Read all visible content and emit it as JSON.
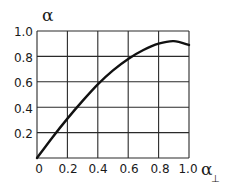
{
  "chart_data": {
    "type": "line",
    "title": "",
    "xlabel": "α⊥",
    "ylabel": "α",
    "xlim": [
      0,
      1.0
    ],
    "ylim": [
      0,
      1.0
    ],
    "grid": true,
    "x_ticks": [
      "0",
      "0.2",
      "0.4",
      "0.6",
      "0.8",
      "1.0"
    ],
    "y_ticks": [
      "0.2",
      "0.4",
      "0.6",
      "0.8",
      "1.0"
    ],
    "series": [
      {
        "name": "α",
        "x": [
          0,
          0.1,
          0.2,
          0.3,
          0.4,
          0.5,
          0.6,
          0.7,
          0.8,
          0.9,
          1.0
        ],
        "values": [
          0,
          0.16,
          0.31,
          0.45,
          0.58,
          0.69,
          0.78,
          0.85,
          0.9,
          0.92,
          0.89
        ]
      }
    ]
  },
  "labels": {
    "y_axis": "α",
    "x_axis_main": "α",
    "x_axis_sub": "⊥",
    "x_ticks": [
      "0",
      "0.2",
      "0.4",
      "0.6",
      "0.8",
      "1.0"
    ],
    "y_ticks": [
      "0.2",
      "0.4",
      "0.6",
      "0.8",
      "1.0"
    ]
  }
}
